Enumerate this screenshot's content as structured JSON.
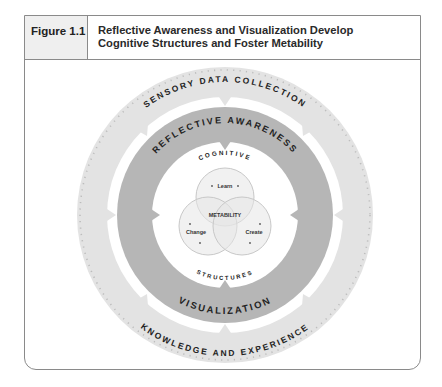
{
  "figure": {
    "label": "Figure 1.1",
    "title_line1": "Reflective Awareness and Visualization Develop",
    "title_line2": "Cognitive Structures and Foster Metability"
  },
  "diagram": {
    "outer_ring": {
      "top_label": "SENSORY DATA COLLECTION",
      "bottom_label": "KNOWLEDGE AND EXPERIENCE",
      "color": "#e2e2e2"
    },
    "middle_ring": {
      "top_label": "REFLECTIVE AWARENESS",
      "bottom_label": "VISUALIZATION",
      "color": "#b5b5b5"
    },
    "inner_disc": {
      "top_label": "COGNITIVE",
      "bottom_label": "STRUCTURES"
    },
    "venn": {
      "center_label": "METABILITY",
      "circles": [
        {
          "label": "Learn"
        },
        {
          "label": "Change"
        },
        {
          "label": "Create"
        }
      ]
    }
  }
}
